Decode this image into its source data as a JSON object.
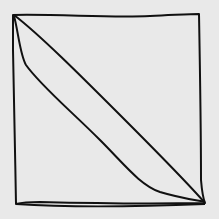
{
  "figure": {
    "description": "Hand-drawn square with a narrow diagonal sliver from top-left to bottom-right corner",
    "background_color": "#e9e9e9",
    "stroke_color": "#111111",
    "shapes": [
      {
        "name": "outer-square",
        "points": [
          [
            13,
            15
          ],
          [
            199,
            14
          ],
          [
            205,
            204
          ],
          [
            16,
            204
          ]
        ]
      },
      {
        "name": "diagonal-upper",
        "points": [
          [
            14,
            15
          ],
          [
            205,
            203
          ]
        ]
      },
      {
        "name": "diagonal-lower",
        "points": [
          [
            14,
            16
          ],
          [
            205,
            200
          ]
        ]
      }
    ]
  }
}
